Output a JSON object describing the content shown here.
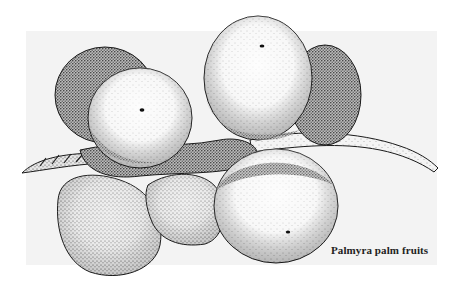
{
  "figure": {
    "caption": "Palmyra palm fruits",
    "colors": {
      "background": "#ffffff",
      "panel": "#f3f3f3",
      "ink": "#1a1a1a",
      "caption": "#222222"
    }
  }
}
